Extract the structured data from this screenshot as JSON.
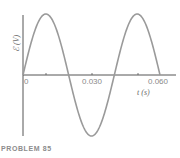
{
  "chart_data": {
    "type": "line",
    "title": "",
    "xlabel": "t (s)",
    "ylabel": "ℰ (V)",
    "xlim": [
      0,
      0.062
    ],
    "x_ticks": [
      0,
      0.01,
      0.02,
      0.03,
      0.04,
      0.05,
      0.06
    ],
    "x_tick_labels": [
      "0",
      "0.030",
      "0.060"
    ],
    "y_ticks": [],
    "grid": false,
    "legend": null,
    "series": [
      {
        "name": "emf",
        "function": "sine",
        "amplitude": 1,
        "period_s": 0.04,
        "x": [
          0,
          0.01,
          0.02,
          0.03,
          0.04,
          0.05,
          0.06
        ],
        "values": [
          0,
          1,
          0,
          -1,
          0,
          1,
          0
        ]
      }
    ],
    "color": "#9a9a9a"
  },
  "labels": {
    "x_tick_0": "0",
    "x_tick_mid": "0.030",
    "x_tick_end": "0.060",
    "xaxis": "t (s)",
    "yaxis": "ℰ (V)",
    "caption": "PROBLEM 85"
  }
}
